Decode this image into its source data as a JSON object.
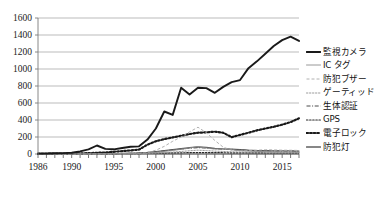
{
  "chart_data": {
    "type": "line",
    "title": "",
    "xlabel": "",
    "ylabel": "",
    "xlim": [
      1986,
      2017
    ],
    "ylim": [
      0,
      1600
    ],
    "ytick_step": 200,
    "grid": true,
    "legend_position": "right",
    "yticks": [
      "0",
      "200",
      "400",
      "600",
      "800",
      "1000",
      "1200",
      "1400",
      "1600"
    ],
    "xticks": [
      "1986",
      "1990",
      "1995",
      "2000",
      "2005",
      "2010",
      "2015"
    ],
    "x": [
      1986,
      1987,
      1988,
      1989,
      1990,
      1991,
      1992,
      1993,
      1994,
      1995,
      1996,
      1997,
      1998,
      1999,
      2000,
      2001,
      2002,
      2003,
      2004,
      2005,
      2006,
      2007,
      2008,
      2009,
      2010,
      2011,
      2012,
      2013,
      2014,
      2015,
      2016,
      2017
    ],
    "series": [
      {
        "name": "監視カメラ",
        "style": "solid-thick",
        "color": "#1a1a1a",
        "values": [
          5,
          6,
          8,
          10,
          15,
          30,
          55,
          100,
          60,
          55,
          70,
          85,
          90,
          170,
          300,
          500,
          460,
          780,
          700,
          780,
          775,
          720,
          790,
          845,
          870,
          1010,
          1090,
          1180,
          1270,
          1340,
          1380,
          1330
        ]
      },
      {
        "name": "IC タグ",
        "style": "solid-thin-light",
        "color": "#8c8c8c",
        "values": [
          0,
          0,
          0,
          0,
          1,
          1,
          2,
          2,
          3,
          4,
          5,
          6,
          8,
          12,
          20,
          30,
          42,
          55,
          70,
          88,
          70,
          58,
          62,
          50,
          40,
          34,
          30,
          28,
          26,
          24,
          22,
          20
        ]
      },
      {
        "name": "防犯ブザー",
        "style": "dashed-light",
        "color": "#b0b0b0",
        "values": [
          0,
          0,
          0,
          0,
          0,
          0,
          0,
          1,
          1,
          2,
          3,
          4,
          6,
          15,
          45,
          90,
          150,
          200,
          260,
          315,
          250,
          160,
          80,
          45,
          40,
          42,
          45,
          50,
          48,
          45,
          44,
          42
        ]
      },
      {
        "name": "ゲーティッド",
        "style": "dotted-light",
        "color": "#9a9a9a",
        "values": [
          0,
          0,
          0,
          0,
          0,
          0,
          0,
          0,
          1,
          1,
          2,
          3,
          4,
          6,
          10,
          16,
          22,
          30,
          38,
          45,
          40,
          34,
          30,
          26,
          24,
          22,
          22,
          20,
          20,
          20,
          20,
          20
        ]
      },
      {
        "name": "生体認証",
        "style": "dashdot",
        "color": "#4a4a4a",
        "values": [
          0,
          0,
          0,
          0,
          0,
          0,
          1,
          1,
          2,
          3,
          5,
          8,
          12,
          18,
          26,
          36,
          48,
          58,
          68,
          74,
          70,
          62,
          58,
          55,
          48,
          42,
          38,
          36,
          34,
          34,
          34,
          32
        ]
      },
      {
        "name": "GPS",
        "style": "dotted-dark",
        "color": "#2b2b2b",
        "values": [
          0,
          0,
          0,
          0,
          0,
          0,
          0,
          1,
          1,
          2,
          3,
          4,
          5,
          7,
          9,
          11,
          13,
          14,
          16,
          17,
          16,
          15,
          15,
          14,
          14,
          13,
          13,
          12,
          12,
          12,
          12,
          12
        ]
      },
      {
        "name": "電子ロック",
        "style": "dotted-thick",
        "color": "#1a1a1a",
        "values": [
          3,
          3,
          4,
          5,
          6,
          8,
          10,
          14,
          18,
          26,
          34,
          42,
          52,
          110,
          150,
          175,
          195,
          215,
          235,
          250,
          255,
          262,
          250,
          198,
          225,
          250,
          278,
          300,
          320,
          345,
          375,
          420
        ]
      },
      {
        "name": "防犯灯",
        "style": "solid-medium",
        "color": "#606060",
        "values": [
          0,
          0,
          0,
          1,
          1,
          2,
          2,
          3,
          4,
          5,
          7,
          9,
          12,
          18,
          28,
          40,
          52,
          62,
          74,
          84,
          78,
          66,
          60,
          58,
          52,
          44,
          40,
          38,
          36,
          36,
          36,
          34
        ]
      }
    ]
  },
  "legend": {
    "items": [
      {
        "label": "監視カメラ"
      },
      {
        "label": "IC タグ"
      },
      {
        "label": "防犯ブザー"
      },
      {
        "label": "ゲーティッド"
      },
      {
        "label": "生体認証"
      },
      {
        "label": "GPS"
      },
      {
        "label": "電子ロック"
      },
      {
        "label": "防犯灯"
      }
    ]
  },
  "axes": {
    "y_ticks": [
      "1600",
      "1400",
      "1200",
      "1000",
      "800",
      "600",
      "400",
      "200",
      "0"
    ],
    "x_ticks": [
      {
        "label": "1986",
        "value": 1986
      },
      {
        "label": "1990",
        "value": 1990
      },
      {
        "label": "1995",
        "value": 1995
      },
      {
        "label": "2000",
        "value": 2000
      },
      {
        "label": "2005",
        "value": 2005
      },
      {
        "label": "2010",
        "value": 2010
      },
      {
        "label": "2015",
        "value": 2015
      }
    ]
  }
}
